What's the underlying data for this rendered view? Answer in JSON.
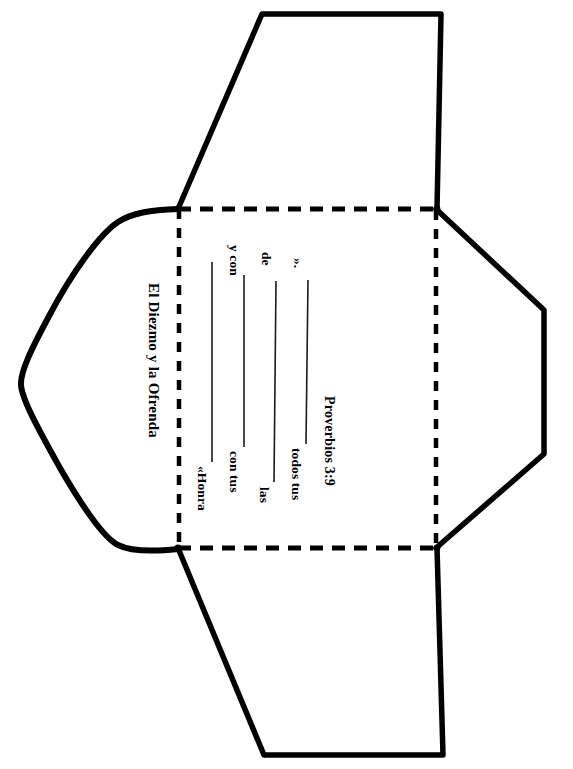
{
  "document": {
    "kind": "envelope-die-cut-template",
    "language": "es",
    "ink_color": "#000000",
    "paper_color": "#ffffff"
  },
  "left_flap": {
    "title": "El Diezmo y la Ofrenda"
  },
  "center_panel": {
    "verse_lines": [
      {
        "id": "line-1",
        "prefix": "«Honra",
        "suffix": ""
      },
      {
        "id": "line-2",
        "prefix": "con tus",
        "suffix": "y con"
      },
      {
        "id": "line-3",
        "prefix": "las",
        "suffix": "de"
      },
      {
        "id": "line-4",
        "prefix": "todos tus",
        "suffix": "»."
      }
    ],
    "reference": "Proverbios 3:9",
    "full_verse": "«Honra ______ con tus ______ y con las ______ de todos tus ______»."
  },
  "geometry": {
    "fold_lines": {
      "style": "dashed",
      "left_x": 178,
      "right_x": 435,
      "top_y": 208,
      "bottom_y": 548
    },
    "cut_lines": {
      "style": "solid"
    }
  }
}
